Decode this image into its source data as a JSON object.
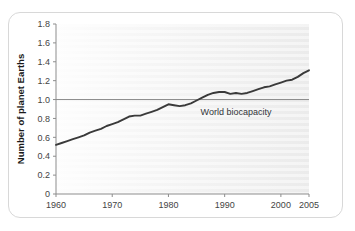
{
  "chart_data": {
    "type": "line",
    "title": "",
    "xlabel": "",
    "ylabel": "Number of planet Earths",
    "xlim": [
      1960,
      2005
    ],
    "ylim": [
      0,
      1.8
    ],
    "grid": false,
    "legend_position": "none",
    "xticks": [
      "1960",
      "1970",
      "1980",
      "1990",
      "2000",
      "2005"
    ],
    "xtick_values": [
      1960,
      1970,
      1980,
      1990,
      2000,
      2005
    ],
    "yticks": [
      "0",
      "0.2",
      "0.4",
      "0.6",
      "0.8",
      "1.0",
      "1.2",
      "1.4",
      "1.6",
      "1.8"
    ],
    "ytick_values": [
      0,
      0.2,
      0.4,
      0.6,
      0.8,
      1.0,
      1.2,
      1.4,
      1.6,
      1.8
    ],
    "series": [
      {
        "name": "Humanity's Ecological Footprint",
        "color": "#3a3a3a",
        "x": [
          1960,
          1961,
          1962,
          1963,
          1964,
          1965,
          1966,
          1967,
          1968,
          1969,
          1970,
          1971,
          1972,
          1973,
          1974,
          1975,
          1976,
          1977,
          1978,
          1979,
          1980,
          1981,
          1982,
          1983,
          1984,
          1985,
          1986,
          1987,
          1988,
          1989,
          1990,
          1991,
          1992,
          1993,
          1994,
          1995,
          1996,
          1997,
          1998,
          1999,
          2000,
          2001,
          2002,
          2003,
          2004,
          2005
        ],
        "values": [
          0.52,
          0.54,
          0.56,
          0.58,
          0.6,
          0.62,
          0.65,
          0.67,
          0.69,
          0.72,
          0.74,
          0.76,
          0.79,
          0.82,
          0.83,
          0.83,
          0.85,
          0.87,
          0.89,
          0.92,
          0.95,
          0.94,
          0.93,
          0.94,
          0.96,
          0.99,
          1.02,
          1.05,
          1.07,
          1.08,
          1.08,
          1.06,
          1.07,
          1.06,
          1.07,
          1.09,
          1.11,
          1.13,
          1.14,
          1.16,
          1.18,
          1.2,
          1.21,
          1.24,
          1.28,
          1.31
        ]
      }
    ],
    "reference_lines": [
      {
        "label": "World biocapacity",
        "value": 1.0,
        "orientation": "horizontal",
        "color": "#8a8a8a"
      }
    ]
  }
}
